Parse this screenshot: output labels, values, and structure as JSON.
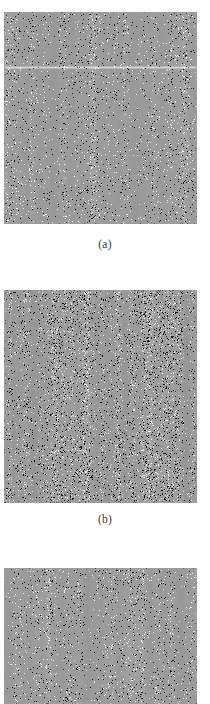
{
  "figure": {
    "panel_count": 3,
    "background_color": "#ffffff",
    "panels": [
      {
        "id": "a",
        "caption": "(a)",
        "base_gray": "#9e9e9e",
        "noise_contrast": 0.42,
        "speckle_density": 0.2,
        "vertical_streak_strength": 0.55,
        "has_horizontal_band": true,
        "horizontal_band_offset": 0.26,
        "seed": 1101,
        "cropped": false
      },
      {
        "id": "b",
        "caption": "(b)",
        "base_gray": "#9e9e9e",
        "noise_contrast": 0.78,
        "speckle_density": 0.42,
        "vertical_streak_strength": 0.7,
        "has_horizontal_band": false,
        "horizontal_band_offset": 0,
        "seed": 2202,
        "cropped": false
      },
      {
        "id": "c",
        "caption": "",
        "base_gray": "#9e9e9e",
        "noise_contrast": 0.46,
        "speckle_density": 0.22,
        "vertical_streak_strength": 0.58,
        "has_horizontal_band": false,
        "horizontal_band_offset": 0,
        "seed": 3303,
        "cropped": true
      }
    ]
  },
  "captions": {
    "a": "(a)",
    "b": "(b)"
  }
}
